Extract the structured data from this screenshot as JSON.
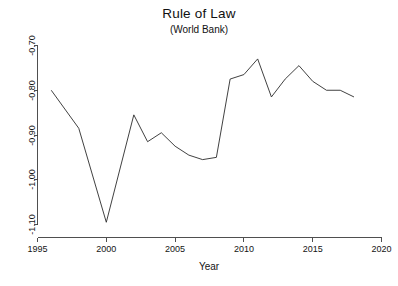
{
  "chart_data": {
    "type": "line",
    "title": "Rule of Law",
    "subtitle": "(World Bank)",
    "xlabel": "Year",
    "ylabel": "",
    "grid": false,
    "legend": false,
    "xlim": [
      1995,
      2020
    ],
    "ylim": [
      -1.1,
      -0.7
    ],
    "xticks": [
      "1995",
      "2000",
      "2005",
      "2010",
      "2015",
      "2020"
    ],
    "xtick_values": [
      1995,
      2000,
      2005,
      2010,
      2015,
      2020
    ],
    "yticks": [
      "-1.10",
      "-1.00",
      "-0.90",
      "-0.80",
      "-0.70"
    ],
    "ytick_values": [
      -1.1,
      -1.0,
      -0.9,
      -0.8,
      -0.7
    ],
    "x": [
      1996,
      1998,
      2000,
      2002,
      2003,
      2004,
      2005,
      2006,
      2007,
      2008,
      2009,
      2010,
      2011,
      2012,
      2013,
      2014,
      2015,
      2016,
      2017,
      2018
    ],
    "values": [
      -0.8,
      -0.885,
      -1.095,
      -0.855,
      -0.915,
      -0.895,
      -0.925,
      -0.945,
      -0.955,
      -0.95,
      -0.775,
      -0.765,
      -0.73,
      -0.815,
      -0.775,
      -0.745,
      -0.78,
      -0.8,
      -0.8,
      -0.815
    ],
    "series": [
      {
        "name": "Rule of Law",
        "color": "#2b2b2b",
        "values": [
          -0.8,
          -0.885,
          -1.095,
          -0.855,
          -0.915,
          -0.895,
          -0.925,
          -0.945,
          -0.955,
          -0.95,
          -0.775,
          -0.765,
          -0.73,
          -0.815,
          -0.775,
          -0.745,
          -0.78,
          -0.8,
          -0.8,
          -0.815
        ]
      }
    ]
  },
  "figure": {
    "title": "Rule of Law",
    "subtitle": "(World Bank)",
    "xlabel": "Year",
    "background": "#ffffff",
    "line_color": "#2b2b2b",
    "axis_color": "#3c3c3c"
  },
  "xticks": {
    "t0": "1995",
    "t1": "2000",
    "t2": "2005",
    "t3": "2010",
    "t4": "2015",
    "t5": "2020"
  },
  "yticks": {
    "t0": "-0.70",
    "t1": "-0.80",
    "t2": "-0.90",
    "t3": "-1.00",
    "t4": "-1.10"
  }
}
